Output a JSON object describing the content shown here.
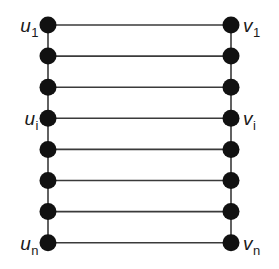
{
  "figure": {
    "name": "ladder-graph-diagram",
    "type": "graph-diagram",
    "background_color": "#ffffff",
    "node_color": "#111111",
    "edge_color": "#3a3a3a",
    "text_color": "#1a1a1a",
    "node_radius": 8.5,
    "edge_width": 1.6,
    "rung_count": 8,
    "columns": [
      {
        "id": "u",
        "x": 48
      },
      {
        "id": "v",
        "x": 231
      }
    ],
    "row_y": [
      25,
      56.1,
      87.2,
      118.3,
      149.4,
      180.5,
      211.6,
      242.7
    ]
  },
  "labels": {
    "left": [
      {
        "id": "u1",
        "base": "u",
        "sub": "1",
        "row": 0,
        "x": 38,
        "y": 25
      },
      {
        "id": "ui",
        "base": "u",
        "sub": "i",
        "row": 3,
        "x": 38,
        "y": 118
      },
      {
        "id": "un",
        "base": "u",
        "sub": "n",
        "row": 7,
        "x": 38,
        "y": 243
      }
    ],
    "right": [
      {
        "id": "v1",
        "base": "v",
        "sub": "1",
        "row": 0,
        "x": 243,
        "y": 25
      },
      {
        "id": "vi",
        "base": "v",
        "sub": "i",
        "row": 3,
        "x": 243,
        "y": 118
      },
      {
        "id": "vn",
        "base": "v",
        "sub": "n",
        "row": 7,
        "x": 243,
        "y": 243
      }
    ]
  }
}
